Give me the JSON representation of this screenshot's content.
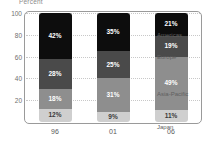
{
  "chart_data": {
    "type": "bar",
    "subtype": "stacked-bar-100",
    "title": "Percent",
    "xlabel": "",
    "ylabel": "",
    "ylim": [
      0,
      100
    ],
    "yticks": [
      20,
      40,
      60,
      80,
      100
    ],
    "ytick_labels": [
      "20",
      "40",
      "60",
      "80",
      "100"
    ],
    "grid": true,
    "legend_position": "right",
    "categories": [
      "96",
      "01",
      "06"
    ],
    "series": [
      {
        "name": "Americas",
        "color": "#0d0d0d",
        "label_color": "light",
        "values": [
          42,
          35,
          21
        ],
        "value_labels": [
          "42%",
          "35%",
          "21%"
        ]
      },
      {
        "name": "Europe",
        "color": "#4a4a4a",
        "label_color": "light",
        "values": [
          28,
          25,
          19
        ],
        "value_labels": [
          "28%",
          "25%",
          "19%"
        ]
      },
      {
        "name": "Asia-Pacific",
        "color": "#8e8e8e",
        "label_color": "light",
        "values": [
          18,
          31,
          49
        ],
        "value_labels": [
          "18%",
          "31%",
          "49%"
        ]
      },
      {
        "name": "Japan",
        "color": "#cfcfcf",
        "label_color": "dark",
        "values": [
          12,
          9,
          11
        ],
        "value_labels": [
          "12%",
          "9%",
          "11%"
        ]
      }
    ]
  },
  "colors": {
    "americas": "#0d0d0d",
    "europe": "#4a4a4a",
    "asia_pacific": "#8e8e8e",
    "japan": "#cfcfcf",
    "frame_border": "#9a9a9a",
    "gridline": "#c8c8c8",
    "axis_text": "#6f6f6f",
    "background": "#ffffff"
  }
}
